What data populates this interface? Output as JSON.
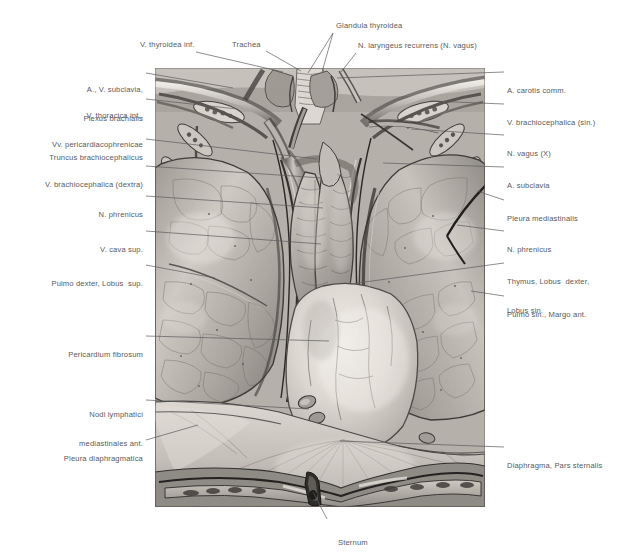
{
  "plate": {
    "title": "Mediastinum anterius — Thymus, Pleura, Pericardium",
    "background_color": "#ffffff",
    "label_color": "#58595b",
    "leader_color": "#5b5c5e",
    "image_area": {
      "x": 155,
      "y": 68,
      "width": 330,
      "height": 439
    }
  },
  "labels": {
    "top": [
      {
        "id": "v-thyroidea-inf",
        "text": "V. thyroidea inf.",
        "x": 140,
        "y": 44,
        "align": "left"
      },
      {
        "id": "trachea",
        "text": "Trachea",
        "x": 232,
        "y": 44,
        "align": "left"
      },
      {
        "id": "glandula-thyroidea",
        "text": "Glandula thyroidea",
        "x": 336,
        "y": 25,
        "align": "left"
      },
      {
        "id": "n-laryngeus-recurrens",
        "text": "N. laryngeus recurrens (N. vagus)",
        "x": 358,
        "y": 45,
        "align": "left"
      }
    ],
    "left": [
      {
        "id": "a-v-subclavia-plexus",
        "lines": [
          "A., V. subclavia,",
          "Plexus brachialis"
        ],
        "x": 143,
        "y": 67
      },
      {
        "id": "v-thoracica-interna",
        "lines": [
          "V. thoracica int.,",
          "Vv. pericardiacophrenicae"
        ],
        "x": 143,
        "y": 93
      },
      {
        "id": "truncus-brachiocephalicus",
        "lines": [
          "Truncus brachiocephalicus"
        ],
        "x": 143,
        "y": 137
      },
      {
        "id": "v-brachiocephalica-dextra",
        "lines": [
          "V. brachiocephalica (dextra)"
        ],
        "x": 143,
        "y": 164
      },
      {
        "id": "n-phrenicus-dexter",
        "lines": [
          "N. phrenicus"
        ],
        "x": 143,
        "y": 194
      },
      {
        "id": "v-cava-superior",
        "lines": [
          "V. cava sup."
        ],
        "x": 143,
        "y": 229
      },
      {
        "id": "pulmo-dexter-lobus-sup",
        "lines": [
          "Pulmo dexter, Lobus  sup."
        ],
        "x": 143,
        "y": 263
      },
      {
        "id": "pericardium-fibrosum",
        "lines": [
          "Pericardium fibrosum"
        ],
        "x": 143,
        "y": 334
      },
      {
        "id": "nodi-lymphatici",
        "lines": [
          "Nodi lymphatici",
          "mediastinales ant."
        ],
        "x": 143,
        "y": 394
      },
      {
        "id": "pleura-diaphragmatica",
        "lines": [
          "Pleura diaphragmatica"
        ],
        "x": 143,
        "y": 438
      }
    ],
    "right": [
      {
        "id": "a-carotis-communis",
        "lines": [
          "A. carotis comm."
        ],
        "x": 507,
        "y": 70
      },
      {
        "id": "v-brachiocephalica-sin",
        "lines": [
          "V. brachiocephalica (sin.)"
        ],
        "x": 507,
        "y": 102
      },
      {
        "id": "n-vagus",
        "lines": [
          "N. vagus (X)"
        ],
        "x": 507,
        "y": 133
      },
      {
        "id": "a-subclavia",
        "lines": [
          "A. subclavia"
        ],
        "x": 507,
        "y": 165
      },
      {
        "id": "pleura-mediastinalis",
        "lines": [
          "Pleura mediastinalis"
        ],
        "x": 507,
        "y": 198
      },
      {
        "id": "n-phrenicus-sinister",
        "lines": [
          "N. phrenicus"
        ],
        "x": 507,
        "y": 229
      },
      {
        "id": "thymus-lobi",
        "lines": [
          "Thymus, Lobus  dexter,",
          "Lobus sin."
        ],
        "x": 507,
        "y": 261
      },
      {
        "id": "pulmo-sinister-margo",
        "lines": [
          "Pulmo sin., Margo ant."
        ],
        "x": 507,
        "y": 294
      },
      {
        "id": "diaphragma-pars-sternalis",
        "lines": [
          "Diaphragma, Pars sternalis"
        ],
        "x": 507,
        "y": 445
      }
    ],
    "bottom": [
      {
        "id": "sternum",
        "lines": [
          "Sternum"
        ],
        "x": 330,
        "y": 523
      }
    ]
  },
  "leaders": [
    {
      "id": "leader-v-thyroidea-inf",
      "points": "196,52 283,72"
    },
    {
      "id": "leader-trachea",
      "points": "266,51 301,71"
    },
    {
      "id": "leader-glandula-thyroidea-a",
      "points": "333,33 308,73"
    },
    {
      "id": "leader-glandula-thyroidea-b",
      "points": "333,33 322,72"
    },
    {
      "id": "leader-n-laryngeus",
      "points": "356,53 341,72"
    },
    {
      "id": "leader-a-v-subclavia",
      "points": "146,73 233,88"
    },
    {
      "id": "leader-v-thoracica-int",
      "points": "146,99 237,109"
    },
    {
      "id": "leader-truncus-brachioceph",
      "points": "146,139 317,159"
    },
    {
      "id": "leader-v-brachioceph-dex",
      "points": "146,166 322,178"
    },
    {
      "id": "leader-n-phrenicus-dex",
      "points": "146,196 323,208"
    },
    {
      "id": "leader-v-cava-sup",
      "points": "146,231 321,244"
    },
    {
      "id": "leader-pulmo-dexter",
      "points": "146,265 215,278"
    },
    {
      "id": "leader-pericardium-fibrosum",
      "points": "146,336 329,341"
    },
    {
      "id": "leader-nodi-lymphatici",
      "points": "146,400 309,409"
    },
    {
      "id": "leader-pleura-diaphragmatica",
      "points": "146,440 198,425"
    },
    {
      "id": "leader-a-carotis-comm",
      "points": "504,72 337,78"
    },
    {
      "id": "leader-v-brachioceph-sin",
      "points": "504,104 430,101"
    },
    {
      "id": "leader-n-vagus",
      "points": "504,135 411,129"
    },
    {
      "id": "leader-a-subclavia",
      "points": "504,167 383,163"
    },
    {
      "id": "leader-pleura-mediastinalis",
      "points": "504,200 477,191"
    },
    {
      "id": "leader-n-phrenicus-sin",
      "points": "504,231 457,225"
    },
    {
      "id": "leader-thymus-lobi",
      "points": "504,263 350,284"
    },
    {
      "id": "leader-pulmo-sin-margo",
      "points": "504,296 471,291"
    },
    {
      "id": "leader-diaphragma-pars-stern",
      "points": "504,447 340,441"
    },
    {
      "id": "leader-sternum",
      "points": "327,519 313,492"
    }
  ],
  "illustration": {
    "description": "Anterior mediastinum dissection: thymus lobes, lungs, pericardium, diaphragm, sternum",
    "tone_light": "#e8e3dc",
    "tone_mid": "#bdb7b0",
    "tone_dark": "#5e5a55",
    "tone_deep": "#2f2d2b",
    "structures": [
      "Glandula thyroidea",
      "Trachea",
      "V. thyroidea inf.",
      "N. laryngeus recurrens (N. vagus)",
      "A. carotis comm.",
      "A., V. subclavia",
      "Plexus brachialis",
      "V. thoracica int.",
      "Vv. pericardiacophrenicae",
      "Truncus brachiocephalicus",
      "V. brachiocephalica (dextra)",
      "V. brachiocephalica (sin.)",
      "N. vagus (X)",
      "A. subclavia",
      "N. phrenicus",
      "V. cava sup.",
      "Pleura mediastinalis",
      "Thymus, Lobus dexter, Lobus sin.",
      "Pulmo dexter, Lobus sup.",
      "Pulmo sin., Margo ant.",
      "Pericardium fibrosum",
      "Nodi lymphatici mediastinales ant.",
      "Pleura diaphragmatica",
      "Diaphragma, Pars sternalis",
      "Sternum"
    ]
  }
}
